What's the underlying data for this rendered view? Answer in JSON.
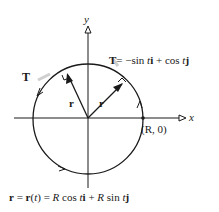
{
  "figure": {
    "axis_x_label": "x",
    "axis_y_label": "y",
    "tangent_label": "T",
    "tangent_equation": {
      "lhs": "T",
      "rhs_parts": [
        "= −sin ",
        "t",
        "i",
        " + cos ",
        "t",
        "j"
      ]
    },
    "radius_label_left": "r",
    "radius_label_right": "r",
    "point_label": "(R, 0)",
    "bottom_equation": {
      "parts": [
        "r",
        " = ",
        "r",
        "(",
        "t",
        ") = ",
        "R",
        " cos ",
        "t",
        "i",
        " + ",
        "R",
        " sin ",
        "t",
        "j"
      ]
    },
    "colors": {
      "stroke": "#1a1a1a",
      "shadow": "#bfbfbf",
      "background": "#ffffff"
    }
  }
}
